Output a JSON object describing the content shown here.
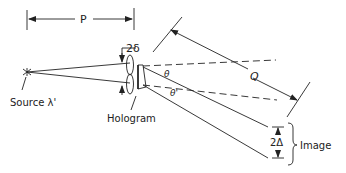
{
  "diagram": {
    "type": "optics-schematic",
    "labels": {
      "p": "P",
      "q": "Q",
      "two_delta": "2δ",
      "theta": "θ",
      "theta_prime": "θ'",
      "source": "Source λ'",
      "hologram": "Hologram",
      "two_Delta": "2Δ",
      "image": "Image"
    },
    "colors": {
      "ink": "#222222",
      "background": "#ffffff"
    }
  }
}
